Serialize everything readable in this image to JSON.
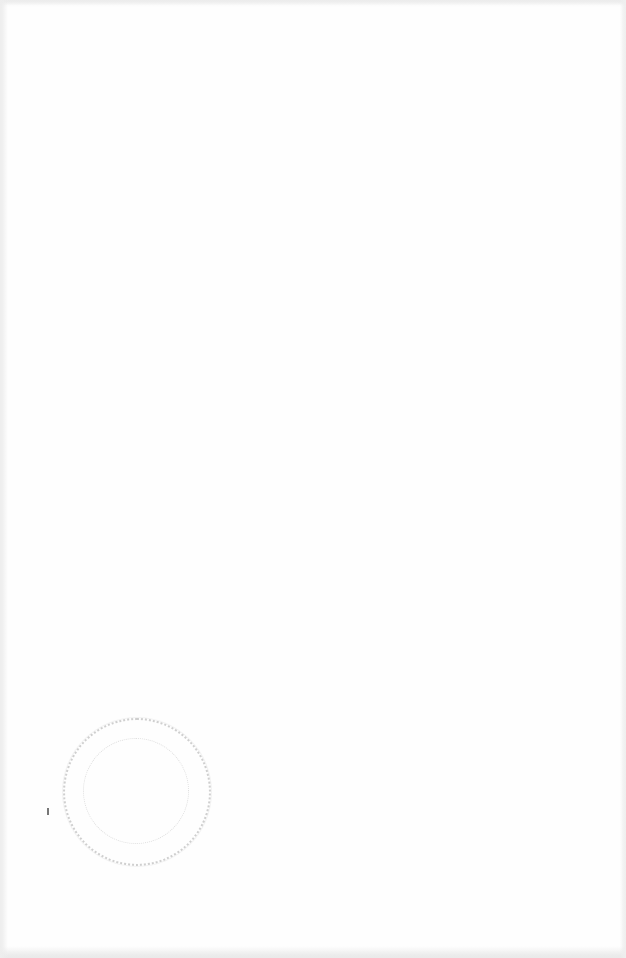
{
  "document": {
    "type": "scanned-blank-page",
    "body_text": "",
    "stamp": {
      "shape": "circle",
      "text": "",
      "legible": false,
      "color": "#8a8a8a"
    }
  }
}
